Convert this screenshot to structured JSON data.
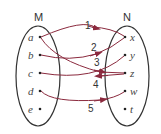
{
  "diagram": {
    "sets": [
      {
        "name": "M",
        "elements": [
          "a",
          "b",
          "c",
          "d",
          "e"
        ]
      },
      {
        "name": "N",
        "elements": [
          "x",
          "y",
          "z",
          "w",
          "t"
        ]
      }
    ],
    "arrows": [
      {
        "label": "1",
        "from": "a",
        "to": "x"
      },
      {
        "label": "2",
        "from": "b",
        "to": "x"
      },
      {
        "label": "3",
        "from": "a",
        "to": "z"
      },
      {
        "label": "4",
        "from": "z",
        "to": "c"
      },
      {
        "label": "5",
        "from": "d",
        "to": "w"
      }
    ],
    "extra_lines": [
      {
        "from": "c",
        "to": "y"
      }
    ],
    "colors": {
      "arrow": "#8b2a3e",
      "ellipse": "#333333",
      "dot": "#222222"
    }
  }
}
